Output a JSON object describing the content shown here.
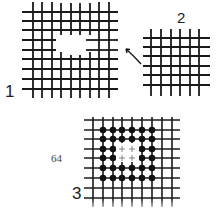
{
  "figure": {
    "labels": {
      "panel1": "1",
      "panel2": "2",
      "panel3": "3"
    },
    "page_number": "64",
    "colors": {
      "line": "#1a1a1a",
      "dot": "#111111",
      "background": "#ffffff"
    },
    "panels": [
      {
        "id": 1,
        "description": "Large grid with missing central region (hole)"
      },
      {
        "id": 2,
        "description": "Smaller intact grid patch, arrow pointing toward hole in grid 1"
      },
      {
        "id": 3,
        "description": "Grid with 6x6 ring of black dots around central 2x2 cross marks"
      }
    ]
  }
}
